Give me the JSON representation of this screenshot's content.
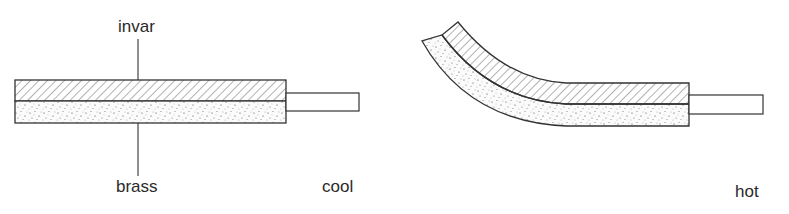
{
  "diagram": {
    "materials": {
      "top_layer": "invar",
      "bottom_layer": "brass"
    },
    "states": {
      "left": "cool",
      "right": "hot"
    },
    "colors": {
      "stroke": "#333333",
      "hatch": "#555555",
      "stipple": "#444444",
      "background": "#ffffff"
    }
  }
}
